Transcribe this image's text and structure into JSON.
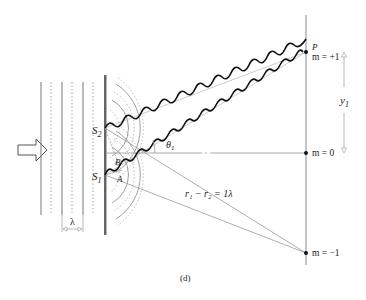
{
  "figure": {
    "caption": "(d)"
  },
  "labels": {
    "slit_top": "S",
    "slit_top_sub": "2",
    "slit_bottom": "S",
    "slit_bottom_sub": "1",
    "point_b": "B",
    "point_a": "A",
    "angle": "θ",
    "angle_sub": "1",
    "point_p": "P",
    "order_plus1": "m = +1",
    "order_zero": "m = 0",
    "order_minus1": "m = −1",
    "distance": "y",
    "distance_sub": "1",
    "wavelength": "λ",
    "path_difference": "r₁ − r₂ = 1λ"
  },
  "colors": {
    "stroke": "#222222",
    "light": "#999999",
    "barrier": "#666666"
  }
}
